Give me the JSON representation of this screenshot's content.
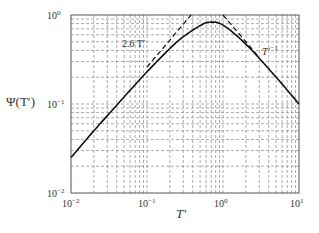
{
  "chart_data": {
    "type": "line",
    "title": "",
    "xlabel": "T′",
    "ylabel": "Ψ(T′)",
    "xscale": "log",
    "yscale": "log",
    "xlim": [
      0.01,
      10
    ],
    "ylim": [
      0.01,
      1
    ],
    "grid": true,
    "grid_style": "dashed",
    "x_ticks": [
      {
        "value": 0.01,
        "base": "10",
        "exp": "−2"
      },
      {
        "value": 0.1,
        "base": "10",
        "exp": "−1"
      },
      {
        "value": 1,
        "base": "10",
        "exp": "0"
      },
      {
        "value": 10,
        "base": "10",
        "exp": "1"
      }
    ],
    "y_ticks": [
      {
        "value": 0.01,
        "base": "10",
        "exp": "−2"
      },
      {
        "value": 0.1,
        "base": "10",
        "exp": "−1"
      },
      {
        "value": 1,
        "base": "10",
        "exp": "0"
      }
    ],
    "series": [
      {
        "name": "Ψ(T′)",
        "style": "solid",
        "x": [
          0.01,
          0.02,
          0.05,
          0.1,
          0.2,
          0.3,
          0.5,
          0.67,
          1,
          2,
          5,
          10
        ],
        "y": [
          0.025,
          0.05,
          0.12,
          0.23,
          0.42,
          0.57,
          0.76,
          0.83,
          0.77,
          0.47,
          0.2,
          0.1
        ]
      },
      {
        "name": "2.6 T′",
        "style": "dashed",
        "x": [
          0.1,
          0.38
        ],
        "y": [
          0.26,
          1.0
        ]
      },
      {
        "name": "T′⁻¹",
        "style": "dashed",
        "x": [
          1.0,
          3.0
        ],
        "y": [
          1.0,
          0.333
        ]
      }
    ],
    "annotations": [
      {
        "text": "2.6 T′",
        "near": "rising asymptote",
        "x": 0.14,
        "y": 0.52
      },
      {
        "text": "T′",
        "sup": "−1",
        "near": "falling asymptote",
        "x": 3.2,
        "y": 0.44
      }
    ]
  },
  "labels": {
    "xlabel": "T′",
    "ylabel": "Ψ(T′)",
    "annot_rise": "2.6 T′",
    "annot_fall_base": "T′",
    "annot_fall_sup": "−1"
  }
}
